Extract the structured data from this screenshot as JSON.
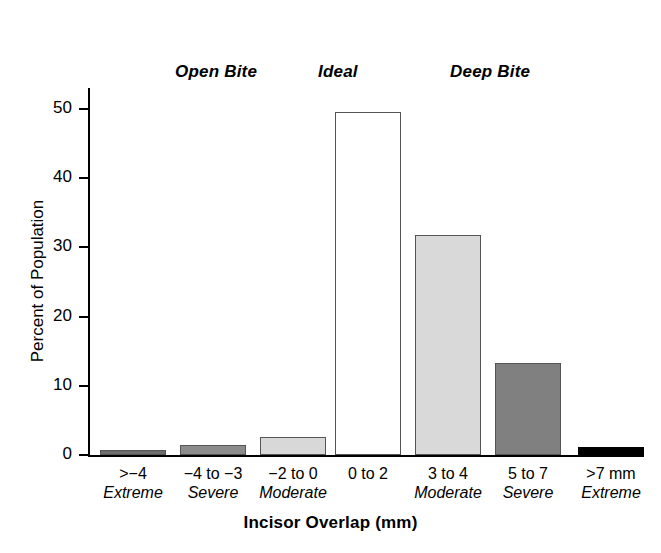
{
  "chart_data": {
    "type": "bar",
    "title": "",
    "xlabel": "Incisor Overlap (mm)",
    "ylabel": "Percent of Population",
    "ylim": [
      0,
      53
    ],
    "yticks": [
      0,
      10,
      20,
      30,
      40,
      50
    ],
    "ytick_labels": [
      "0",
      "10",
      "20",
      "30",
      "40",
      "50"
    ],
    "grid": false,
    "legend": "none",
    "categories": [
      ">−4",
      "−4 to −3",
      "−2 to 0",
      "0 to 2",
      "3 to 4",
      "5 to 7",
      ">7 mm"
    ],
    "subcategories": [
      "Extreme",
      "Severe",
      "Moderate",
      "",
      "Moderate",
      "Severe",
      "Extreme"
    ],
    "values": [
      0.7,
      1.4,
      2.6,
      49.5,
      31.8,
      13.3,
      1.2
    ],
    "bar_colors": [
      "#6E6E6E",
      "#8C8C8C",
      "#D8D8D8",
      "#FFFFFF",
      "#D9D9D9",
      "#808080",
      "#000000"
    ],
    "group_annotations": [
      {
        "label": "Open Bite",
        "spans": [
          ">−4",
          "−4 to −3",
          "−2 to 0"
        ]
      },
      {
        "label": "Ideal",
        "spans": [
          "0 to 2"
        ]
      },
      {
        "label": "Deep Bite",
        "spans": [
          "3 to 4",
          "5 to 7",
          ">7 mm"
        ]
      }
    ]
  },
  "axes": {
    "y_title": "Percent of Population",
    "x_title": "Incisor Overlap (mm)",
    "y_ticks": [
      {
        "label": "50",
        "value": 50
      },
      {
        "label": "40",
        "value": 40
      },
      {
        "label": "30",
        "value": 30
      },
      {
        "label": "20",
        "value": 20
      },
      {
        "label": "10",
        "value": 10
      },
      {
        "label": "0",
        "value": 0
      }
    ]
  },
  "groups": {
    "open_bite": "Open Bite",
    "ideal": "Ideal",
    "deep_bite": "Deep Bite"
  },
  "categories": [
    {
      "top": ">−4",
      "sub": "Extreme",
      "value": 0.7,
      "color": "#6E6E6E"
    },
    {
      "top": "−4 to −3",
      "sub": "Severe",
      "value": 1.4,
      "color": "#8C8C8C"
    },
    {
      "top": "−2 to 0",
      "sub": "Moderate",
      "value": 2.6,
      "color": "#D8D8D8"
    },
    {
      "top": "0 to 2",
      "sub": "",
      "value": 49.5,
      "color": "#FFFFFF"
    },
    {
      "top": "3 to 4",
      "sub": "Moderate",
      "value": 31.8,
      "color": "#D9D9D9"
    },
    {
      "top": "5 to 7",
      "sub": "Severe",
      "value": 13.3,
      "color": "#808080"
    },
    {
      "top": ">7 mm",
      "sub": "Extreme",
      "value": 1.2,
      "color": "#000000"
    }
  ]
}
